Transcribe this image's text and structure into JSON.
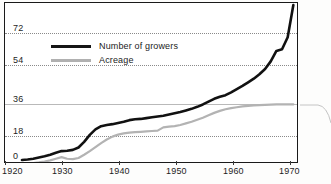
{
  "chart_data": {
    "type": "line",
    "title": "",
    "subtitle": "",
    "xlabel": "",
    "ylabel": "",
    "xlim": [
      1920,
      1972
    ],
    "ylim": [
      0,
      80
    ],
    "grid": true,
    "grid_axis": "y",
    "legend_position": "upper-left-inside",
    "xticks": [
      1920,
      1930,
      1940,
      1950,
      1960,
      1970
    ],
    "xtick_labels": [
      "1920",
      "1930",
      "1940",
      "1950",
      "1960",
      "1970"
    ],
    "yticks": [
      0,
      18,
      36,
      54,
      72
    ],
    "ytick_labels": [
      "0",
      "18",
      "36",
      "54",
      "72"
    ],
    "series": [
      {
        "name": "Number of growers",
        "color": "#111111",
        "x": [
          1923,
          1924,
          1925,
          1926,
          1927,
          1928,
          1929,
          1930,
          1931,
          1932,
          1933,
          1934,
          1935,
          1936,
          1937,
          1938,
          1939,
          1940,
          1941,
          1942,
          1943,
          1944,
          1945,
          1946,
          1947,
          1948,
          1949,
          1950,
          1951,
          1952,
          1953,
          1954,
          1955,
          1956,
          1957,
          1958,
          1959,
          1960,
          1961,
          1962,
          1963,
          1964,
          1965,
          1966,
          1967,
          1968,
          1969,
          1970,
          1971
        ],
        "values": [
          2.0,
          2.2,
          2.6,
          3.2,
          3.8,
          4.6,
          5.6,
          6.4,
          6.6,
          7.0,
          8.2,
          11.0,
          14.5,
          17.2,
          18.8,
          19.4,
          19.8,
          20.4,
          21.0,
          21.8,
          22.2,
          22.4,
          22.8,
          23.2,
          23.6,
          24.0,
          24.6,
          25.2,
          25.8,
          26.6,
          27.4,
          28.4,
          29.6,
          31.0,
          32.4,
          33.4,
          34.2,
          35.6,
          37.2,
          38.8,
          40.6,
          42.4,
          44.6,
          47.2,
          51.0,
          56.2,
          57.0,
          63.0,
          79.0
        ]
      },
      {
        "name": "Acreage",
        "color": "#b3b3b3",
        "x": [
          1923,
          1924,
          1925,
          1926,
          1927,
          1928,
          1929,
          1930,
          1931,
          1932,
          1933,
          1934,
          1935,
          1936,
          1937,
          1938,
          1939,
          1940,
          1941,
          1942,
          1943,
          1944,
          1945,
          1946,
          1947,
          1948,
          1949,
          1950,
          1951,
          1952,
          1953,
          1954,
          1955,
          1956,
          1957,
          1958,
          1959,
          1960,
          1961,
          1962,
          1963,
          1964,
          1965,
          1966,
          1967,
          1968,
          1969,
          1970,
          1971
        ],
        "values": [
          0.2,
          0.3,
          0.5,
          0.8,
          1.2,
          1.8,
          2.6,
          3.4,
          2.6,
          2.4,
          3.0,
          4.6,
          6.4,
          8.4,
          10.4,
          12.2,
          13.6,
          14.6,
          15.2,
          15.6,
          15.8,
          16.0,
          16.2,
          16.4,
          16.6,
          18.2,
          18.6,
          18.8,
          19.4,
          20.2,
          21.0,
          22.0,
          23.0,
          24.2,
          25.4,
          26.4,
          27.2,
          27.8,
          28.2,
          28.6,
          28.9,
          29.1,
          29.3,
          29.4,
          29.5,
          29.6,
          29.6,
          29.6,
          29.6
        ]
      }
    ]
  },
  "legend": {
    "items": [
      {
        "label": "Number of growers",
        "swatch": "black-line-swatch"
      },
      {
        "label": "Acreage",
        "swatch": "gray-line-swatch"
      }
    ]
  },
  "axes": {
    "y": {
      "labels": [
        "72",
        "54",
        "36",
        "18",
        "0"
      ]
    },
    "x": {
      "labels": [
        "1920",
        "1930",
        "1940",
        "1950",
        "1960",
        "1970"
      ]
    }
  },
  "colors": {
    "growers_line": "#111111",
    "acreage_line": "#b3b3b3",
    "frame": "#1a1a1a",
    "gridline_dotted": "#8a8a8a",
    "gridline_solid": "#b9b9b9",
    "text": "#1e1e1e",
    "background": "#ffffff"
  }
}
